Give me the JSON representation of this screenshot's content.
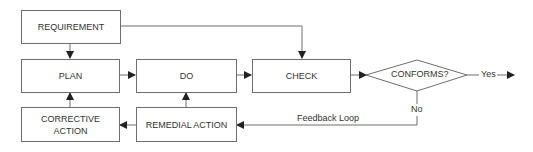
{
  "diagram": {
    "nodes": {
      "requirement": "REQUIREMENT",
      "plan": "PLAN",
      "do": "DO",
      "check": "CHECK",
      "conforms": "CONFORMS?",
      "corrective_line1": "CORRECTIVE",
      "corrective_line2": "ACTION",
      "remedial": "REMEDIAL ACTION"
    },
    "edge_labels": {
      "yes": "Yes",
      "no": "No",
      "feedback": "Feedback Loop"
    },
    "colors": {
      "line": "#6e6e6e",
      "text": "#333333",
      "arrow": "#222222"
    }
  }
}
